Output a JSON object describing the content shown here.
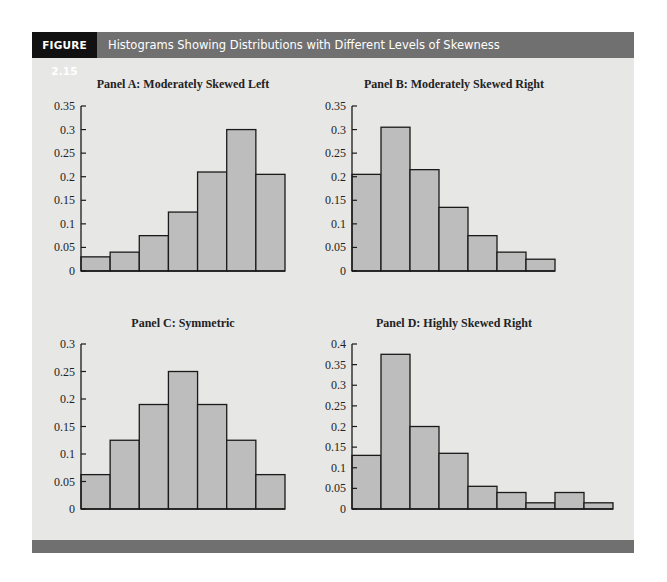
{
  "figure": {
    "label": "FIGURE 2.15",
    "title": "Histograms Showing Distributions with Different Levels of Skewness"
  },
  "colors": {
    "header_label_bg": "#111111",
    "header_bar_bg": "#707070",
    "panel_bg": "#e7e7e6",
    "bar_fill": "#bdbdbd",
    "bar_stroke": "#1a1a1a"
  },
  "chart_data": [
    {
      "type": "bar",
      "title": "Panel A: Moderately Skewed Left",
      "xlabel": "",
      "ylabel": "",
      "categories": [
        "1",
        "2",
        "3",
        "4",
        "5",
        "6",
        "7"
      ],
      "values": [
        0.03,
        0.04,
        0.075,
        0.125,
        0.21,
        0.3,
        0.205
      ],
      "ylim": [
        0,
        0.35
      ],
      "yticks": [
        "0",
        "0.05",
        "0.1",
        "0.15",
        "0.2",
        "0.25",
        "0.3",
        "0.35"
      ],
      "grid": false,
      "legend": null
    },
    {
      "type": "bar",
      "title": "Panel B: Moderately Skewed Right",
      "xlabel": "",
      "ylabel": "",
      "categories": [
        "1",
        "2",
        "3",
        "4",
        "5",
        "6",
        "7"
      ],
      "values": [
        0.205,
        0.305,
        0.215,
        0.135,
        0.075,
        0.04,
        0.025
      ],
      "ylim": [
        0,
        0.35
      ],
      "yticks": [
        "0",
        "0.05",
        "0.1",
        "0.15",
        "0.2",
        "0.25",
        "0.3",
        "0.35"
      ],
      "grid": false,
      "legend": null
    },
    {
      "type": "bar",
      "title": "Panel C: Symmetric",
      "xlabel": "",
      "ylabel": "",
      "categories": [
        "1",
        "2",
        "3",
        "4",
        "5",
        "6",
        "7"
      ],
      "values": [
        0.0625,
        0.125,
        0.19,
        0.25,
        0.19,
        0.125,
        0.0625
      ],
      "ylim": [
        0,
        0.3
      ],
      "yticks": [
        "0",
        "0.05",
        "0.1",
        "0.15",
        "0.2",
        "0.25",
        "0.3"
      ],
      "grid": false,
      "legend": null
    },
    {
      "type": "bar",
      "title": "Panel D: Highly Skewed Right",
      "xlabel": "",
      "ylabel": "",
      "categories": [
        "1",
        "2",
        "3",
        "4",
        "5",
        "6",
        "7",
        "8",
        "9"
      ],
      "values": [
        0.13,
        0.375,
        0.2,
        0.135,
        0.055,
        0.04,
        0.015,
        0.04,
        0.015
      ],
      "ylim": [
        0,
        0.4
      ],
      "yticks": [
        "0",
        "0.05",
        "0.1",
        "0.15",
        "0.2",
        "0.25",
        "0.3",
        "0.35",
        "0.4"
      ],
      "grid": false,
      "legend": null
    }
  ]
}
